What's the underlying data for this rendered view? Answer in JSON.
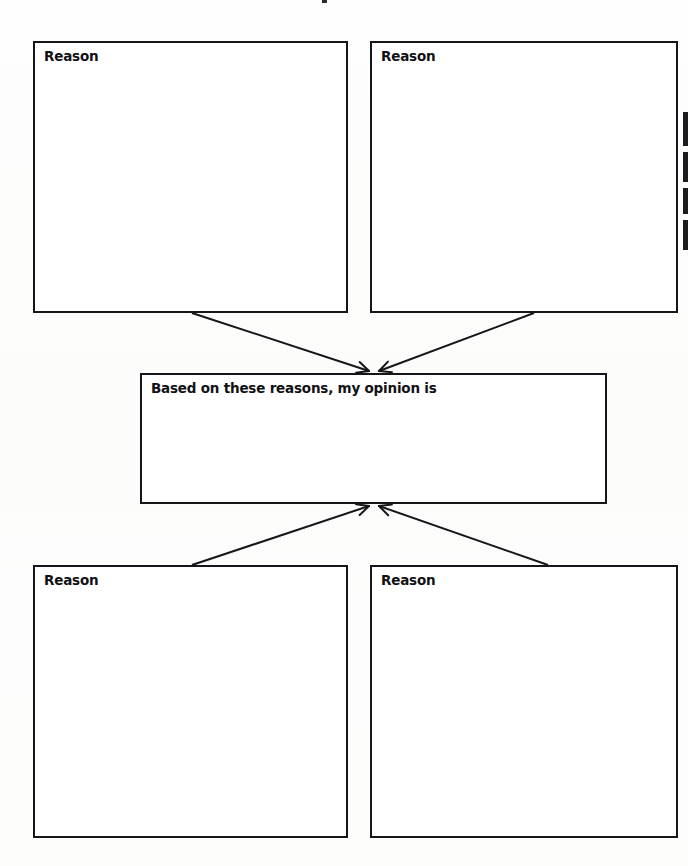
{
  "worksheet": {
    "type": "opinion-writing-graphic-organizer",
    "width": 688,
    "height": 866,
    "background_color": "#fdfdfc",
    "line_color": "#16161a"
  },
  "boxes": {
    "top_left": {
      "label": "Reason",
      "x": 33,
      "y": 41,
      "width": 315,
      "height": 272
    },
    "top_right": {
      "label": "Reason",
      "x": 370,
      "y": 41,
      "width": 308,
      "height": 272
    },
    "center": {
      "label": "Based on these reasons, my opinion is",
      "x": 140,
      "y": 373,
      "width": 467,
      "height": 131
    },
    "bottom_left": {
      "label": "Reason",
      "x": 33,
      "y": 565,
      "width": 315,
      "height": 273
    },
    "bottom_right": {
      "label": "Reason",
      "x": 370,
      "y": 565,
      "width": 308,
      "height": 273
    }
  },
  "arrows": [
    {
      "name": "arrow-top-left-to-center",
      "from": "top_left",
      "to": "center",
      "start_x": 192,
      "start_y": 313,
      "end_x": 369,
      "end_y": 371,
      "direction": "down-right"
    },
    {
      "name": "arrow-top-right-to-center",
      "from": "top_right",
      "to": "center",
      "start_x": 534,
      "start_y": 313,
      "end_x": 379,
      "end_y": 371,
      "direction": "down-left"
    },
    {
      "name": "arrow-bottom-left-to-center",
      "from": "bottom_left",
      "to": "center",
      "start_x": 192,
      "start_y": 565,
      "end_x": 369,
      "end_y": 506,
      "direction": "up-right"
    },
    {
      "name": "arrow-bottom-right-to-center",
      "from": "bottom_right",
      "to": "center",
      "start_x": 548,
      "start_y": 565,
      "end_x": 379,
      "end_y": 506,
      "direction": "up-left"
    }
  ],
  "page_edge_marks": [
    {
      "name": "binding-mark-1",
      "top": 112,
      "height": 34
    },
    {
      "name": "binding-mark-2",
      "top": 152,
      "height": 30
    },
    {
      "name": "binding-mark-3",
      "top": 188,
      "height": 26
    },
    {
      "name": "binding-mark-4",
      "top": 220,
      "height": 30
    }
  ]
}
